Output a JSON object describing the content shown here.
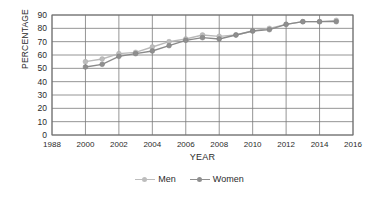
{
  "chart_data": {
    "type": "line",
    "title": "",
    "xlabel": "YEAR",
    "ylabel": "PERCENTAGE",
    "xlim": [
      1998,
      2016
    ],
    "ylim": [
      0,
      90
    ],
    "grid": true,
    "legend_position": "bottom",
    "x_tick_labels": [
      "1988",
      "2000",
      "2002",
      "2004",
      "2006",
      "2008",
      "2010",
      "2012",
      "2014",
      "2016"
    ],
    "x_tick_values": [
      1998,
      2000,
      2002,
      2004,
      2006,
      2008,
      2010,
      2012,
      2014,
      2016
    ],
    "y_tick_labels": [
      "0",
      "10",
      "20",
      "30",
      "40",
      "50",
      "60",
      "70",
      "80",
      "90"
    ],
    "y_tick_values": [
      0,
      10,
      20,
      30,
      40,
      50,
      60,
      70,
      80,
      90
    ],
    "x": [
      2000,
      2001,
      2002,
      2003,
      2004,
      2005,
      2006,
      2007,
      2008,
      2009,
      2010,
      2011,
      2012,
      2013,
      2014,
      2015
    ],
    "series": [
      {
        "name": "Men",
        "color": "#bdbdbd",
        "values": [
          55,
          57,
          61,
          62,
          66,
          70,
          72,
          75,
          74,
          75,
          78,
          80,
          83,
          85,
          85,
          86
        ]
      },
      {
        "name": "Women",
        "color": "#8f8f8f",
        "values": [
          51,
          53,
          59,
          61,
          63,
          67,
          71,
          73,
          72,
          75,
          78,
          79,
          83,
          85,
          85,
          85
        ]
      }
    ]
  },
  "legend": {
    "items": [
      {
        "label": "Men",
        "color": "#bdbdbd"
      },
      {
        "label": "Women",
        "color": "#8f8f8f"
      }
    ]
  },
  "axes": {
    "x_title": "YEAR",
    "y_title": "PERCENTAGE"
  }
}
